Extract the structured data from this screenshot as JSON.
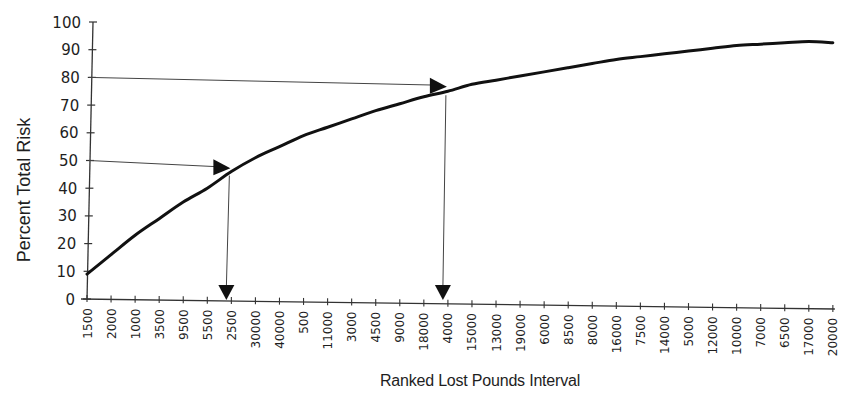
{
  "chart_data": {
    "type": "line",
    "title": "",
    "xlabel": "Ranked Lost Pounds Interval",
    "ylabel": "Percent Total Risk",
    "ylim": [
      0,
      100
    ],
    "yticks": [
      0,
      10,
      20,
      30,
      40,
      50,
      60,
      70,
      80,
      90,
      100
    ],
    "grid": false,
    "legend": null,
    "categories": [
      "1500",
      "2000",
      "1000",
      "3500",
      "9500",
      "5500",
      "2500",
      "30000",
      "40000",
      "500",
      "11000",
      "3000",
      "4500",
      "9000",
      "18000",
      "4000",
      "15000",
      "13000",
      "19000",
      "6000",
      "8500",
      "8000",
      "16000",
      "7500",
      "14000",
      "5000",
      "12000",
      "10000",
      "7000",
      "6500",
      "17000",
      "20000"
    ],
    "series": [
      {
        "name": "Cumulative Percent Total Risk",
        "values": [
          9,
          16,
          23,
          29,
          35,
          40,
          46,
          51,
          55,
          59,
          62,
          65,
          68,
          70.5,
          73,
          75,
          77.5,
          79,
          80.5,
          82,
          83.5,
          85,
          86.5,
          87.5,
          88.5,
          89.5,
          90.5,
          91.5,
          92,
          92.5,
          93,
          92.5
        ]
      }
    ],
    "annotations": [
      {
        "type": "arrow",
        "from_y": 50,
        "to_category": "2500",
        "description": "Horizontal arrow at 50% to curve, then vertical arrow down to x-axis at 2500"
      },
      {
        "type": "arrow",
        "from_y": 80,
        "to_category": "4000",
        "description": "Horizontal arrow at 80% to curve, then vertical arrow down to x-axis at 4000"
      }
    ]
  },
  "colors": {
    "line": "#111111",
    "axis": "#333333",
    "arrow": "#444444",
    "text": "#1e1e1e",
    "background": "#ffffff"
  }
}
